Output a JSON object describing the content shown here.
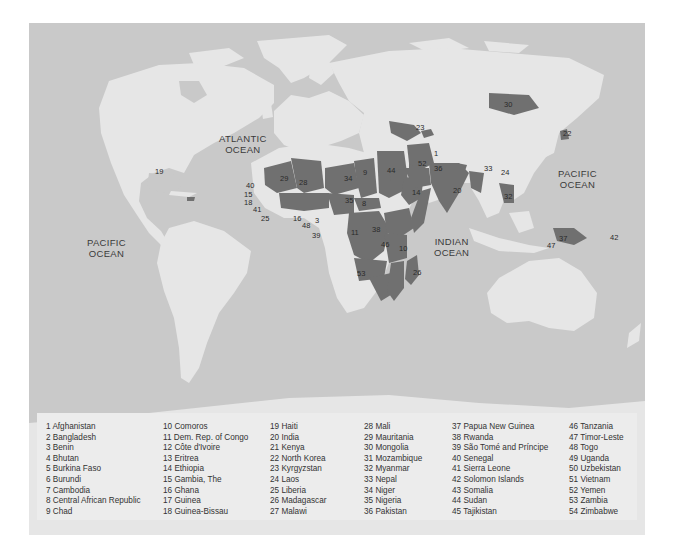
{
  "map": {
    "colors": {
      "ocean": "#c9c9c9",
      "land": "#e6e6e6",
      "highlighted": "#707070",
      "borders": "#f5f5f5",
      "legend_bg": "#ececec",
      "text": "#333333"
    },
    "ocean_labels": [
      {
        "line1": "ATLANTIC",
        "line2": "OCEAN"
      },
      {
        "line1": "PACIFIC",
        "line2": "OCEAN"
      },
      {
        "line1": "INDIAN",
        "line2": "OCEAN"
      },
      {
        "line1": "PACIFIC",
        "line2": "OCEAN"
      }
    ],
    "markers": [
      "1",
      "2",
      "3",
      "4",
      "5",
      "6",
      "7",
      "8",
      "9",
      "10",
      "11",
      "12",
      "13",
      "14",
      "15",
      "16",
      "17",
      "18",
      "19",
      "20",
      "21",
      "22",
      "23",
      "24",
      "25",
      "26",
      "27",
      "28",
      "29",
      "30",
      "31",
      "32",
      "33",
      "34",
      "35",
      "36",
      "37",
      "38",
      "39",
      "40",
      "41",
      "42",
      "43",
      "44",
      "45",
      "46",
      "47",
      "48",
      "49",
      "50",
      "51",
      "52",
      "53",
      "54"
    ]
  },
  "legend": {
    "columns": [
      [
        "1 Afghanistan",
        "2 Bangladesh",
        "3 Benin",
        "4 Bhutan",
        "5 Burkina Faso",
        "6 Burundi",
        "7 Cambodia",
        "8 Central African Republic",
        "9 Chad"
      ],
      [
        "10 Comoros",
        "11 Dem. Rep. of Congo",
        "12 Côte d'Ivoire",
        "13 Eritrea",
        "14 Ethiopia",
        "15 Gambia, The",
        "16 Ghana",
        "17 Guinea",
        "18 Guinea-Bissau"
      ],
      [
        "19 Haiti",
        "20 India",
        "21 Kenya",
        "22 North Korea",
        "23 Kyrgyzstan",
        "24 Laos",
        "25 Liberia",
        "26 Madagascar",
        "27 Malawi"
      ],
      [
        "28 Mali",
        "29 Mauritania",
        "30 Mongolia",
        "31 Mozambique",
        "32 Myanmar",
        "33 Nepal",
        "34 Niger",
        "35 Nigeria",
        "36 Pakistan"
      ],
      [
        "37 Papua New Guinea",
        "38 Rwanda",
        "39 São Tomé and Príncipe",
        "40 Senegal",
        "41 Sierra Leone",
        "42 Solomon Islands",
        "43 Somalia",
        "44 Sudan",
        "45 Tajikistan"
      ],
      [
        "46 Tanzania",
        "47 Timor-Leste",
        "48 Togo",
        "49 Uganda",
        "50 Uzbekistan",
        "51 Vietnam",
        "52 Yemen",
        "53 Zambia",
        "54 Zimbabwe"
      ]
    ]
  }
}
